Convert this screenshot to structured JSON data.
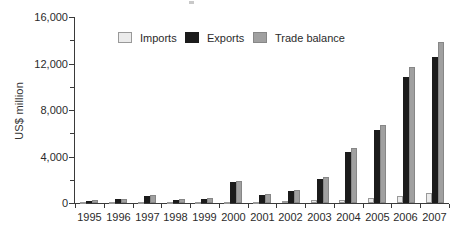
{
  "chart_data": {
    "type": "bar",
    "title": "",
    "xlabel": "",
    "ylabel": "US$ million",
    "ylim": [
      0,
      16000
    ],
    "y_major_ticks": [
      0,
      4000,
      8000,
      12000,
      16000
    ],
    "y_tick_labels": [
      "0",
      "4,000",
      "8,000",
      "12,000",
      "16,000"
    ],
    "y_minor_ticks": [
      2000,
      6000,
      10000,
      14000
    ],
    "grid": false,
    "legend_position": "top",
    "categories": [
      "1995",
      "1996",
      "1997",
      "1998",
      "1999",
      "2000",
      "2001",
      "2002",
      "2003",
      "2004",
      "2005",
      "2006",
      "2007"
    ],
    "series": [
      {
        "name": "Imports",
        "color": "#ebebeb",
        "border": "#999999",
        "values": [
          60,
          70,
          90,
          70,
          90,
          110,
          110,
          160,
          220,
          280,
          420,
          620,
          880
        ]
      },
      {
        "name": "Exports",
        "color": "#1b1b1b",
        "border": "#1b1b1b",
        "values": [
          180,
          310,
          560,
          230,
          380,
          1780,
          680,
          1000,
          2030,
          4400,
          6250,
          10820,
          12540
        ]
      },
      {
        "name": "Trade balance",
        "color": "#a0a0a0",
        "border": "#878787",
        "values": [
          240,
          380,
          660,
          320,
          440,
          1900,
          780,
          1120,
          2230,
          4700,
          6700,
          11680,
          13890
        ]
      }
    ]
  }
}
